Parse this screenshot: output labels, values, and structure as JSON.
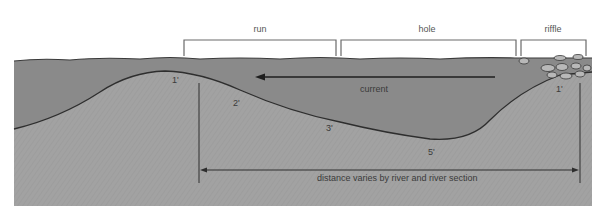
{
  "sections": [
    {
      "label": "run"
    },
    {
      "label": "hole"
    },
    {
      "label": "riffle"
    }
  ],
  "current": {
    "label": "current",
    "direction": "left"
  },
  "depths": [
    {
      "label": "1'",
      "position": "run crest"
    },
    {
      "label": "2'",
      "position": "run slope"
    },
    {
      "label": "3'",
      "position": "hole slope"
    },
    {
      "label": "5'",
      "position": "hole bottom"
    },
    {
      "label": "1'",
      "position": "riffle"
    }
  ],
  "distance": {
    "label": "distance varies by river and river section"
  },
  "colors": {
    "water": "#8a8a8a",
    "riverbed": "#a2a2a2",
    "outline": "#2e2e2e",
    "bracket": "#6a6a6a",
    "background": "#ffffff"
  }
}
